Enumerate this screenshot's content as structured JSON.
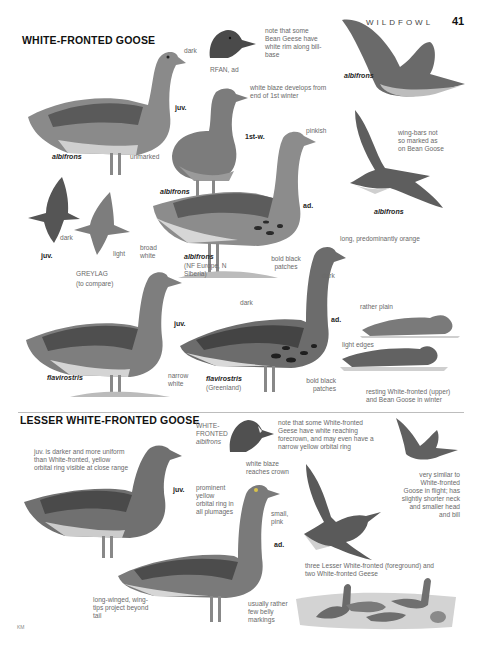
{
  "page": {
    "running_head": "WILDFOWL",
    "page_number": "41",
    "artist_credit": "KM"
  },
  "white_fronted": {
    "title": "WHITE-FRONTED GOOSE",
    "labels": {
      "juv_age": "juv.",
      "juv_taxon": "albifrons",
      "dark": "dark",
      "unmarked": "unmarked",
      "rfan_caption": "RFAN, ad",
      "bean_note": "note that some Bean Geese have white rim along bill-base",
      "blaze_note": "white blaze develops from end of 1st winter",
      "firstw_age": "1st-w.",
      "firstw_taxon": "albifrons",
      "pinkish": "pinkish",
      "ad_age": "ad.",
      "ad_taxon": "albifrons",
      "ad_region": "(NF Europe, N Siberia)",
      "bold_black_patches_1": "bold black patches",
      "broad_white": "broad white",
      "flight_upper_taxon": "albifrons",
      "wingbars_note": "wing-bars not so marked as on Bean Goose",
      "flight_lower_taxon": "albifrons",
      "flight_juv_age": "juv.",
      "flight_dark": "dark",
      "flight_light": "light",
      "greylag": "GREYLAG",
      "greylag_sub": "(to compare)",
      "flav_juv_age": "juv.",
      "flav_juv_taxon": "flavirostris",
      "narrow_white": "narrow white",
      "flav_ad_dark_back": "dark",
      "flav_ad_bill": "long, predominantly orange",
      "flav_ad_dark_head": "dark",
      "flav_ad_age": "ad.",
      "flav_ad_taxon": "flavirostris",
      "flav_ad_region": "(Greenland)",
      "bold_black_patches_2": "bold black patches",
      "rather_plain": "rather plain",
      "light_edges": "light edges",
      "resting_caption": "resting White-fronted (upper) and Bean Goose in winter"
    }
  },
  "lesser_white_fronted": {
    "title": "LESSER WHITE-FRONTED GOOSE",
    "labels": {
      "juv_note": "juv. is darker and more uniform than White-fronted, yellow orbital ring visible at close range",
      "juv_age": "juv.",
      "wf_head_caption_1": "WHITE-",
      "wf_head_caption_2": "FRONTED",
      "wf_head_taxon": "albifrons",
      "wf_note": "note that some White-fronted Geese have white reaching forecrown, and may even have a narrow yellow orbital ring",
      "blaze_crown": "white blaze reaches crown",
      "orbital_ring": "prominent yellow orbital ring in all plumages",
      "small_pink": "small, pink",
      "ad_age": "ad.",
      "long_winged": "long-winged, wing-tips project beyond tail",
      "belly_markings": "usually rather few belly markings",
      "flight_note": "very similar to White-fronted Goose in flight; has slightly shorter neck and smaller head and bill",
      "group_caption": "three Lesser White-fronted (foreground) and two White-fronted Geese"
    }
  },
  "colors": {
    "heading": "#111111",
    "annotation": "#6a6a6a",
    "divider": "#bdbdbd",
    "plumage_dark": "#4a4a4a",
    "plumage_mid": "#7a7a7a",
    "plumage_light": "#b8b8b8"
  }
}
